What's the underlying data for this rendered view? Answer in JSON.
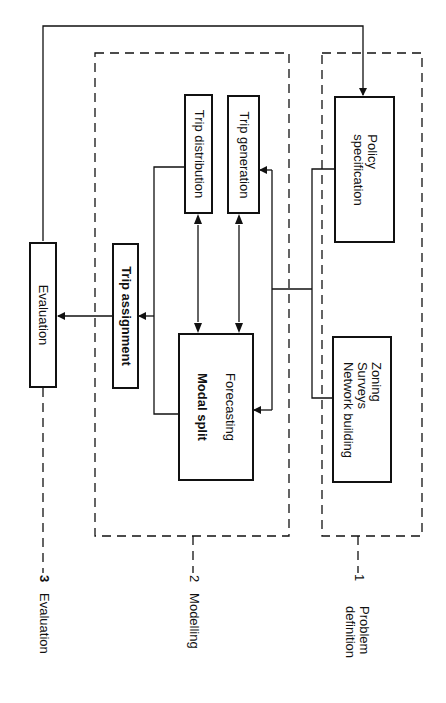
{
  "diagram": {
    "stages": [
      {
        "number": "3",
        "name": "Evaluation"
      },
      {
        "number": "2",
        "name": "Modelling"
      },
      {
        "number": "1",
        "name": "Problem definition",
        "name_line1": "Problem",
        "name_line2": "definition"
      }
    ],
    "boxes": {
      "evaluation": "Evaluation",
      "trip_assignment": "Trip assignment",
      "trip_distribution": "Trip distribution",
      "trip_generation": "Trip generation",
      "forecasting": "Forecasting",
      "modal_split": "Modal split",
      "policy_line1": "Policy",
      "policy_line2": "specification",
      "zoning_line1": "Zoning",
      "zoning_line2": "Surveys",
      "zoning_line3": "Network building"
    },
    "colors": {
      "line": "#111111",
      "background": "#ffffff"
    }
  }
}
